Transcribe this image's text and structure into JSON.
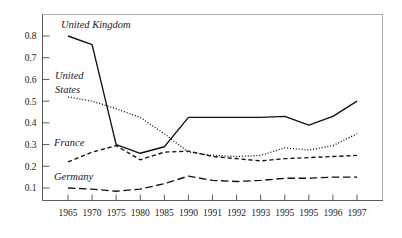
{
  "chart_data": {
    "type": "line",
    "title": "",
    "subtitle": "",
    "xlabel": "",
    "ylabel": "",
    "grid": false,
    "legend_position": "in-plot-annotations",
    "categories": [
      "1965",
      "1970",
      "1975",
      "1980",
      "1985",
      "1990",
      "1991",
      "1992",
      "1993",
      "1995",
      "1995",
      "1996",
      "1997"
    ],
    "ylim": [
      0.0,
      0.85
    ],
    "yticks": [
      "0.1",
      "0.2",
      "0.3",
      "0.4",
      "0.5",
      "0.6",
      "0.7",
      "0.8"
    ],
    "ytick_values": [
      0.1,
      0.2,
      0.3,
      0.4,
      0.5,
      0.6,
      0.7,
      0.8
    ],
    "series": [
      {
        "name": "United Kingdom",
        "style": "solid",
        "annotation": "United Kingdom",
        "values": [
          0.8,
          0.76,
          0.3,
          0.26,
          0.29,
          0.425,
          0.425,
          0.425,
          0.425,
          0.43,
          0.39,
          0.43,
          0.5
        ]
      },
      {
        "name": "United States",
        "style": "dotted",
        "annotation_line1": "United",
        "annotation_line2": "States",
        "values": [
          0.52,
          0.5,
          0.465,
          0.425,
          0.35,
          0.265,
          0.25,
          0.245,
          0.25,
          0.285,
          0.275,
          0.295,
          0.35
        ]
      },
      {
        "name": "France",
        "style": "dashed",
        "annotation": "France",
        "values": [
          0.22,
          0.265,
          0.295,
          0.23,
          0.265,
          0.27,
          0.245,
          0.235,
          0.225,
          0.235,
          0.24,
          0.245,
          0.25
        ]
      },
      {
        "name": "Germany",
        "style": "long-dashed",
        "annotation": "Germany",
        "values": [
          0.1,
          0.095,
          0.085,
          0.095,
          0.12,
          0.155,
          0.135,
          0.13,
          0.135,
          0.145,
          0.145,
          0.15,
          0.15
        ]
      }
    ],
    "colors": {
      "line": "#111111",
      "axis": "#4a4a4a",
      "frame": "#9a9a9a",
      "text": "#1a1a1a",
      "background": "#ffffff"
    }
  },
  "annotations": {
    "united_kingdom": "United Kingdom",
    "united_states_line1": "United",
    "united_states_line2": "States",
    "france": "France",
    "germany": "Germany"
  }
}
